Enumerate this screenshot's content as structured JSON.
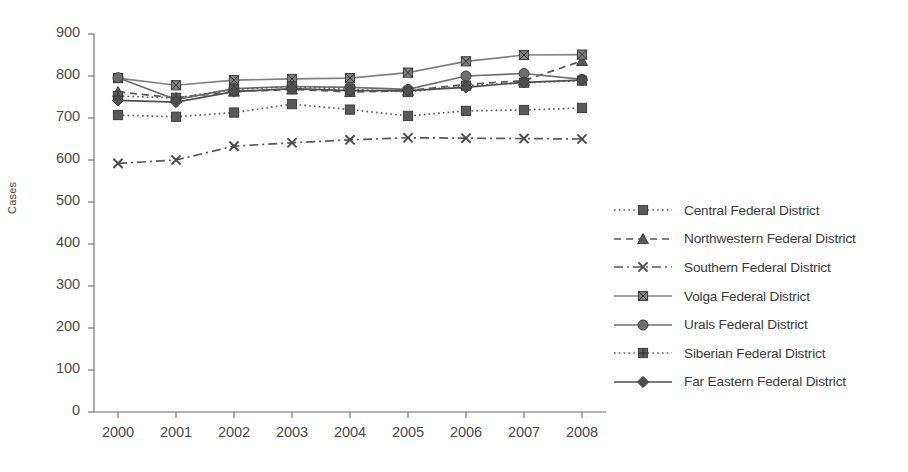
{
  "chart_data": {
    "type": "line",
    "title": "",
    "xlabel": "",
    "ylabel": "Cases",
    "categories": [
      "2000",
      "2001",
      "2002",
      "2003",
      "2004",
      "2005",
      "2006",
      "2007",
      "2008"
    ],
    "x": [
      2000,
      2001,
      2002,
      2003,
      2004,
      2005,
      2006,
      2007,
      2008
    ],
    "ylim": [
      0,
      900
    ],
    "ytick_labels": [
      "0",
      "100",
      "200",
      "300",
      "400",
      "500",
      "600",
      "700",
      "800",
      "900"
    ],
    "yticks": [
      0,
      100,
      200,
      300,
      400,
      500,
      600,
      700,
      800,
      900
    ],
    "grid": false,
    "legend_position": "right",
    "series": [
      {
        "name": "Central Federal District",
        "marker": "square",
        "line_style": "dotted",
        "color": "#595959",
        "values": [
          707,
          703,
          713,
          733,
          720,
          705,
          717,
          719,
          724
        ]
      },
      {
        "name": "Northwestern Federal District",
        "marker": "triangle",
        "line_style": "dashed",
        "color": "#595959",
        "values": [
          762,
          748,
          763,
          768,
          762,
          765,
          780,
          789,
          836
        ]
      },
      {
        "name": "Southern Federal District",
        "marker": "x",
        "line_style": "dash-dot",
        "color": "#595959",
        "values": [
          592,
          600,
          633,
          641,
          648,
          653,
          652,
          651,
          650
        ]
      },
      {
        "name": "Volga Federal District",
        "marker": "square-x",
        "line_style": "solid",
        "color": "#808080",
        "values": [
          795,
          778,
          790,
          793,
          795,
          808,
          835,
          850,
          851
        ]
      },
      {
        "name": "Urals Federal District",
        "marker": "circle",
        "line_style": "solid",
        "color": "#6e6e6e",
        "values": [
          796,
          744,
          770,
          775,
          773,
          768,
          800,
          806,
          792
        ]
      },
      {
        "name": "Siberian Federal District",
        "marker": "grid-square",
        "line_style": "dotted",
        "color": "#5c5c5c",
        "values": [
          752,
          748,
          768,
          775,
          768,
          762,
          777,
          784,
          789
        ]
      },
      {
        "name": "Far Eastern Federal District",
        "marker": "diamond",
        "line_style": "solid",
        "color": "#4f4f4f",
        "values": [
          742,
          738,
          763,
          770,
          765,
          765,
          773,
          785,
          790
        ]
      }
    ]
  },
  "axis": {
    "y_title": "Cases"
  }
}
